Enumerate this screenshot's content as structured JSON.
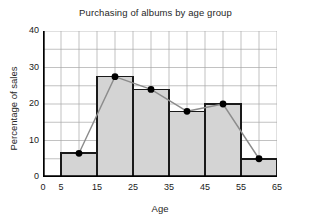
{
  "chart_data": {
    "type": "bar",
    "title": "Purchasing of albums by age group",
    "xlabel": "Age",
    "ylabel": "Percentage of sales",
    "xlim": [
      0,
      65
    ],
    "ylim": [
      0,
      40
    ],
    "grid": true,
    "legend": "none",
    "x_ticks": [
      0,
      5,
      15,
      25,
      35,
      45,
      55,
      65
    ],
    "x_tick_labels": [
      "0",
      "5",
      "15",
      "25",
      "35",
      "45",
      "55",
      "65"
    ],
    "y_ticks": [
      0,
      10,
      20,
      30,
      40
    ],
    "y_tick_labels": [
      "0",
      "10",
      "20",
      "30",
      "40"
    ],
    "y_gridline_step": 5,
    "x_gridline_step": 5,
    "bin_edges": [
      5,
      15,
      25,
      35,
      45,
      55,
      65
    ],
    "categories": [
      "5-15",
      "15-25",
      "25-35",
      "35-45",
      "45-55",
      "55-65"
    ],
    "values": [
      6.5,
      27.5,
      24,
      18,
      20,
      5
    ],
    "series": [
      {
        "name": "Percentage of sales",
        "type": "bar",
        "values": [
          6.5,
          27.5,
          24,
          18,
          20,
          5
        ]
      },
      {
        "name": "Frequency polygon",
        "type": "line",
        "x": [
          10,
          20,
          30,
          40,
          50,
          60
        ],
        "values": [
          6.5,
          27.5,
          24,
          18,
          20,
          5
        ]
      }
    ],
    "colors": {
      "bar_fill": "#d4d4d4",
      "bar_edge": "#1a1a1a",
      "line": "#8c8c8c",
      "marker": "#000000",
      "grid": "#a8a8a8",
      "axis": "#000000",
      "text": "#262626",
      "background": "#ffffff"
    }
  }
}
